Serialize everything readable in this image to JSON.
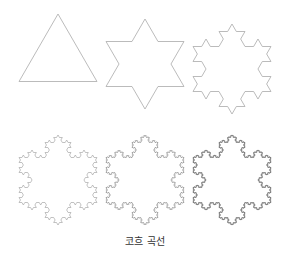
{
  "figure": {
    "caption": "코흐 곡선",
    "stroke_color": "#9a9a9a",
    "panels": [
      {
        "name": "koch-iteration-0",
        "iteration": 0,
        "cx": 58,
        "cy": 59,
        "r": 45,
        "stroke": "#aaaaaa",
        "width": 0.8
      },
      {
        "name": "koch-iteration-1",
        "iteration": 1,
        "cx": 145,
        "cy": 64,
        "r": 45,
        "stroke": "#aaaaaa",
        "width": 0.8
      },
      {
        "name": "koch-iteration-2",
        "iteration": 2,
        "cx": 232,
        "cy": 69,
        "r": 45,
        "stroke": "#aaaaaa",
        "width": 0.8
      },
      {
        "name": "koch-iteration-3",
        "iteration": 3,
        "cx": 58,
        "cy": 180,
        "r": 45,
        "stroke": "#a8a8a8",
        "width": 0.7
      },
      {
        "name": "koch-iteration-4",
        "iteration": 4,
        "cx": 145,
        "cy": 180,
        "r": 45,
        "stroke": "#8a8a8a",
        "width": 0.7
      },
      {
        "name": "koch-iteration-5",
        "iteration": 5,
        "cx": 232,
        "cy": 180,
        "r": 45,
        "stroke": "#555555",
        "width": 0.7
      }
    ]
  }
}
